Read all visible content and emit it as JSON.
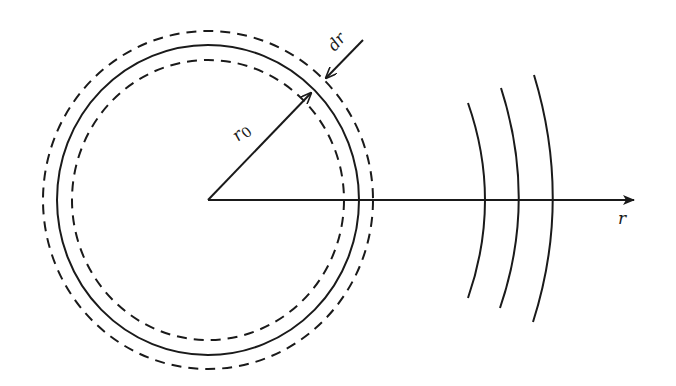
{
  "diagram": {
    "colors": {
      "stroke": "#1a1a1a",
      "background": "#ffffff"
    },
    "labels": {
      "radius": "r",
      "radius_subscript": "0",
      "shell_thickness": "dr",
      "axis": "r"
    },
    "center": {
      "x": 208,
      "y": 200
    },
    "circles": {
      "inner_dashed": {
        "rx": 136,
        "ry": 140,
        "style": "dashed"
      },
      "solid": {
        "rx": 151,
        "ry": 155,
        "style": "solid"
      },
      "outer_dashed": {
        "rx": 165,
        "ry": 169,
        "style": "dashed"
      }
    },
    "axis": {
      "x_start": 208,
      "x_end": 634,
      "y": 200
    },
    "wavefronts": [
      {
        "top": [
          468,
          103
        ],
        "mid": [
          485,
          200
        ],
        "bottom": [
          468,
          298
        ]
      },
      {
        "top": [
          501,
          88
        ],
        "mid": [
          519,
          200
        ],
        "bottom": [
          500,
          308
        ]
      },
      {
        "top": [
          534,
          75
        ],
        "mid": [
          553,
          200
        ],
        "bottom": [
          533,
          322
        ]
      }
    ]
  }
}
